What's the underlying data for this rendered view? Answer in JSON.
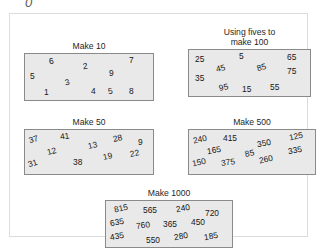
{
  "artifact": {
    "glyph": "0"
  },
  "worksheet": {
    "groups": [
      {
        "id": "make-10",
        "title": "Make 10",
        "numbers": [
          {
            "value": "6",
            "x": 24,
            "y": 3,
            "rot": -10
          },
          {
            "value": "2",
            "x": 58,
            "y": 8,
            "rot": -8
          },
          {
            "value": "7",
            "x": 104,
            "y": 2,
            "rot": 0
          },
          {
            "value": "5",
            "x": 5,
            "y": 18,
            "rot": 0
          },
          {
            "value": "9",
            "x": 84,
            "y": 15,
            "rot": 0
          },
          {
            "value": "3",
            "x": 40,
            "y": 24,
            "rot": -12
          },
          {
            "value": "1",
            "x": 19,
            "y": 34,
            "rot": 0
          },
          {
            "value": "4",
            "x": 66,
            "y": 33,
            "rot": 0
          },
          {
            "value": "5",
            "x": 83,
            "y": 33,
            "rot": -10
          },
          {
            "value": "8",
            "x": 104,
            "y": 33,
            "rot": 0
          }
        ]
      },
      {
        "id": "fives-100",
        "title": "Using fives to\nmake 100",
        "numbers": [
          {
            "value": "25",
            "x": 6,
            "y": 5,
            "rot": 0
          },
          {
            "value": "5",
            "x": 50,
            "y": 2,
            "rot": 0
          },
          {
            "value": "65",
            "x": 98,
            "y": 3,
            "rot": 0
          },
          {
            "value": "45",
            "x": 27,
            "y": 14,
            "rot": -14
          },
          {
            "value": "85",
            "x": 68,
            "y": 13,
            "rot": -16
          },
          {
            "value": "75",
            "x": 98,
            "y": 17,
            "rot": 0
          },
          {
            "value": "35",
            "x": 6,
            "y": 24,
            "rot": 0
          },
          {
            "value": "95",
            "x": 30,
            "y": 33,
            "rot": -12
          },
          {
            "value": "15",
            "x": 53,
            "y": 35,
            "rot": 0
          },
          {
            "value": "55",
            "x": 81,
            "y": 33,
            "rot": 0
          }
        ]
      },
      {
        "id": "make-50",
        "title": "Make 50",
        "numbers": [
          {
            "value": "37",
            "x": 4,
            "y": 5,
            "rot": -16
          },
          {
            "value": "41",
            "x": 35,
            "y": 2,
            "rot": -8
          },
          {
            "value": "13",
            "x": 63,
            "y": 11,
            "rot": -12
          },
          {
            "value": "28",
            "x": 88,
            "y": 4,
            "rot": -14
          },
          {
            "value": "9",
            "x": 113,
            "y": 8,
            "rot": 0
          },
          {
            "value": "12",
            "x": 22,
            "y": 17,
            "rot": -14
          },
          {
            "value": "19",
            "x": 78,
            "y": 22,
            "rot": -12
          },
          {
            "value": "22",
            "x": 105,
            "y": 19,
            "rot": -12
          },
          {
            "value": "31",
            "x": 3,
            "y": 29,
            "rot": -18
          },
          {
            "value": "38",
            "x": 48,
            "y": 28,
            "rot": 0
          }
        ]
      },
      {
        "id": "make-500",
        "title": "Make 500",
        "numbers": [
          {
            "value": "240",
            "x": 4,
            "y": 5,
            "rot": -12
          },
          {
            "value": "415",
            "x": 34,
            "y": 4,
            "rot": 0
          },
          {
            "value": "350",
            "x": 68,
            "y": 9,
            "rot": -10
          },
          {
            "value": "125",
            "x": 100,
            "y": 2,
            "rot": -12
          },
          {
            "value": "165",
            "x": 18,
            "y": 16,
            "rot": -10
          },
          {
            "value": "85",
            "x": 56,
            "y": 19,
            "rot": -12
          },
          {
            "value": "335",
            "x": 99,
            "y": 16,
            "rot": -10
          },
          {
            "value": "150",
            "x": 3,
            "y": 28,
            "rot": -12
          },
          {
            "value": "375",
            "x": 32,
            "y": 28,
            "rot": -8
          },
          {
            "value": "260",
            "x": 70,
            "y": 25,
            "rot": -12
          }
        ]
      },
      {
        "id": "make-1000",
        "title": "Make 1000",
        "numbers": [
          {
            "value": "815",
            "x": 8,
            "y": 3,
            "rot": -12
          },
          {
            "value": "565",
            "x": 37,
            "y": 5,
            "rot": 0
          },
          {
            "value": "240",
            "x": 70,
            "y": 3,
            "rot": -10
          },
          {
            "value": "720",
            "x": 99,
            "y": 8,
            "rot": 0
          },
          {
            "value": "635",
            "x": 4,
            "y": 17,
            "rot": -10
          },
          {
            "value": "760",
            "x": 30,
            "y": 20,
            "rot": -8
          },
          {
            "value": "365",
            "x": 57,
            "y": 19,
            "rot": 0
          },
          {
            "value": "450",
            "x": 85,
            "y": 17,
            "rot": 0
          },
          {
            "value": "435",
            "x": 4,
            "y": 31,
            "rot": -10
          },
          {
            "value": "550",
            "x": 40,
            "y": 35,
            "rot": 0
          },
          {
            "value": "280",
            "x": 68,
            "y": 31,
            "rot": -10
          },
          {
            "value": "185",
            "x": 98,
            "y": 31,
            "rot": -10
          }
        ]
      }
    ]
  },
  "colors": {
    "box_fill": "#e9e9e9",
    "box_border": "#8a8a8a",
    "frame_border": "#dcdcdc",
    "text": "#171717",
    "page_background": "#ffffff"
  }
}
